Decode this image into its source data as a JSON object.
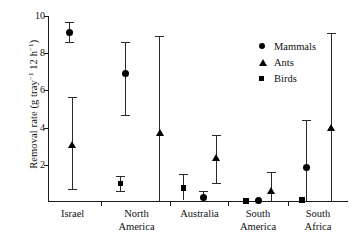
{
  "chart_data": {
    "type": "scatter",
    "title": "",
    "subtitle": "",
    "xlabel": "",
    "ylabel_plain": "Removal rate (g tray-1 12 h-1)",
    "ylabel_parts": {
      "prefix": "Removal rate (g tray",
      "sup1": "−1",
      "mid": " 12 h",
      "sup2": "−1",
      "suffix": ")"
    },
    "ylim": [
      0,
      10
    ],
    "yticks": [
      2,
      4,
      6,
      8,
      10
    ],
    "ytick_labels": [
      "2",
      "4",
      "6",
      "8",
      "10"
    ],
    "grid": false,
    "legend_position": "upper-right",
    "categories": [
      "Israel",
      "North America",
      "Australia",
      "South America",
      "South Africa"
    ],
    "category_labels": [
      "Israel",
      "North\nAmerica",
      "Australia",
      "South\nAmerica",
      "South\nAfrica"
    ],
    "series": [
      {
        "name": "Mammals",
        "marker": "circle",
        "values": [
          9.1,
          6.9,
          0.25,
          0.06,
          1.85
        ],
        "err_low": [
          8.6,
          4.7,
          0.0,
          0.0,
          0.0
        ],
        "err_high": [
          9.7,
          8.6,
          0.6,
          0.0,
          4.4
        ]
      },
      {
        "name": "Ants",
        "marker": "triangle",
        "values": [
          3.1,
          3.75,
          2.4,
          0.6,
          4.0
        ],
        "err_low": [
          0.7,
          0.0,
          1.0,
          0.0,
          0.0
        ],
        "err_high": [
          5.65,
          8.9,
          3.6,
          1.6,
          9.1
        ]
      },
      {
        "name": "Birds",
        "marker": "square",
        "values": [
          null,
          1.0,
          0.75,
          0.06,
          0.1
        ],
        "err_low": [
          null,
          0.6,
          0.1,
          0.0,
          0.0
        ],
        "err_high": [
          null,
          1.4,
          1.5,
          0.0,
          0.0
        ]
      }
    ],
    "points": [
      {
        "group": "Israel",
        "series": "Mammals",
        "x_frac": 0.072,
        "value": 9.1,
        "low": 8.6,
        "high": 9.7
      },
      {
        "group": "Israel",
        "series": "Ants",
        "x_frac": 0.082,
        "value": 3.1,
        "low": 0.7,
        "high": 5.65
      },
      {
        "group": "North America",
        "series": "Mammals",
        "x_frac": 0.258,
        "value": 6.9,
        "low": 4.7,
        "high": 8.6
      },
      {
        "group": "North America",
        "series": "Birds",
        "x_frac": 0.242,
        "value": 1.0,
        "low": 0.6,
        "high": 1.4
      },
      {
        "group": "North America",
        "series": "Ants",
        "x_frac": 0.373,
        "value": 3.75,
        "low": 0.0,
        "high": 8.9
      },
      {
        "group": "Australia",
        "series": "Birds",
        "x_frac": 0.452,
        "value": 0.75,
        "low": 0.1,
        "high": 1.5
      },
      {
        "group": "Australia",
        "series": "Mammals",
        "x_frac": 0.518,
        "value": 0.25,
        "low": 0.0,
        "high": 0.6
      },
      {
        "group": "Australia",
        "series": "Ants",
        "x_frac": 0.562,
        "value": 2.4,
        "low": 1.0,
        "high": 3.6
      },
      {
        "group": "South America",
        "series": "Birds",
        "x_frac": 0.66,
        "value": 0.06,
        "low": 0.0,
        "high": 0.0
      },
      {
        "group": "South America",
        "series": "Mammals",
        "x_frac": 0.7,
        "value": 0.06,
        "low": 0.0,
        "high": 0.0
      },
      {
        "group": "South America",
        "series": "Ants",
        "x_frac": 0.745,
        "value": 0.6,
        "low": 0.0,
        "high": 1.6
      },
      {
        "group": "South Africa",
        "series": "Birds",
        "x_frac": 0.847,
        "value": 0.1,
        "low": 0.0,
        "high": 0.0
      },
      {
        "group": "South Africa",
        "series": "Mammals",
        "x_frac": 0.862,
        "value": 1.85,
        "low": 0.0,
        "high": 4.4
      },
      {
        "group": "South Africa",
        "series": "Ants",
        "x_frac": 0.945,
        "value": 4.0,
        "low": 0.0,
        "high": 9.1
      }
    ],
    "group_separators_x_frac": [
      0.175,
      0.405,
      0.6,
      0.8
    ],
    "group_label_centers_x_frac": [
      0.082,
      0.295,
      0.505,
      0.7,
      0.9
    ],
    "legend": [
      {
        "label": "Mammals",
        "marker": "circle"
      },
      {
        "label": "Ants",
        "marker": "triangle"
      },
      {
        "label": "Birds",
        "marker": "square"
      }
    ]
  }
}
